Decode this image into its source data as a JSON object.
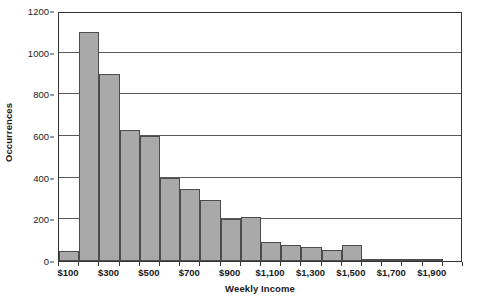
{
  "chart_data": {
    "type": "bar",
    "title": "",
    "xlabel": "Weekly Income",
    "ylabel": "Occurrences",
    "ylim": [
      0,
      1200
    ],
    "yticks": [
      0,
      200,
      400,
      600,
      800,
      1000,
      1200
    ],
    "ytick_labels": [
      "0",
      "200",
      "400",
      "600",
      "800",
      "1000",
      "1200"
    ],
    "grid": true,
    "legend": "none",
    "bin_width": 100,
    "categories": [
      "$100",
      "$200",
      "$300",
      "$400",
      "$500",
      "$600",
      "$700",
      "$800",
      "$900",
      "$1,000",
      "$1,100",
      "$1,200",
      "$1,300",
      "$1,400",
      "$1,500",
      "$1,600",
      "$1,700",
      "$1,800",
      "$1,900",
      "$2,000"
    ],
    "values": [
      50,
      1100,
      900,
      630,
      600,
      400,
      345,
      295,
      200,
      210,
      90,
      75,
      65,
      55,
      75,
      8,
      12,
      5,
      12,
      0
    ],
    "xtick_labels": [
      "$100",
      "$300",
      "$500",
      "$700",
      "$900",
      "$1,100",
      "$1,300",
      "$1,500",
      "$1,700",
      "$1,900"
    ],
    "xtick_label_bin_index": [
      0,
      2,
      4,
      6,
      8,
      10,
      12,
      14,
      16,
      18
    ],
    "colors": {
      "bar_fill": "#a9a9a9",
      "bar_stroke": "#4c4c4c",
      "grid": "#5a5a5a",
      "axis": "#333333",
      "text": "#1a1a1a",
      "background": "#ffffff"
    }
  }
}
